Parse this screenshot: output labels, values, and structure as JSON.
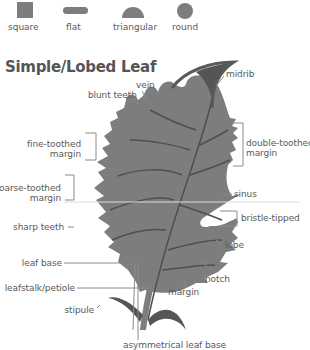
{
  "shapes": [
    {
      "name": "square",
      "label": "square"
    },
    {
      "name": "flat",
      "label": "flat"
    },
    {
      "name": "triangular",
      "label": "triangular"
    },
    {
      "name": "round",
      "label": "round"
    }
  ],
  "title": "Simple/Lobed Leaf",
  "labels": {
    "vein": "vein",
    "blunt_teeth": "blunt teeth",
    "midrib": "midrib",
    "fine_toothed_1": "fine-toothed",
    "fine_toothed_2": "margin",
    "double_toothed_1": "double-toothed",
    "double_toothed_2": "margin",
    "coarse_toothed_1": "coarse-toothed",
    "coarse_toothed_2": "margin",
    "sinus": "sinus",
    "bristle_tipped": "bristle-tipped",
    "sharp_teeth": "sharp teeth",
    "lobe": "lobe",
    "leaf_base": "leaf base",
    "notch": "notch",
    "leafstalk": "leafstalk/petiole",
    "margin": "margin",
    "stipule": "stipule",
    "asym_base": "asymmetrical leaf base"
  },
  "colors": {
    "leaf": "#7d7d7d",
    "vein": "#4f4f4f",
    "midrib_tip": "#555555",
    "line": "#8a8a8a",
    "text": "#5a5a5a"
  }
}
